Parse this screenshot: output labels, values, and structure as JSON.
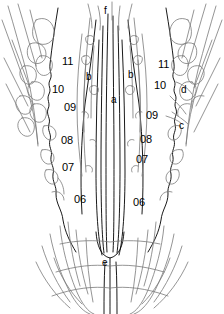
{
  "figure": {
    "type": "line-drawing-anatomical-diagram",
    "background_color": "#ffffff",
    "ink_color": "#000000",
    "light_ink_color": "#808080",
    "width": 224,
    "height": 314
  },
  "labels": [
    {
      "id": "f",
      "text": "f",
      "kind": "letter",
      "x": 106,
      "y": 12
    },
    {
      "id": "b-left",
      "text": "b",
      "kind": "letter",
      "x": 88,
      "y": 78
    },
    {
      "id": "b-right",
      "text": "b",
      "kind": "letter",
      "x": 130,
      "y": 76
    },
    {
      "id": "a",
      "text": "a",
      "kind": "letter",
      "x": 113,
      "y": 101
    },
    {
      "id": "d",
      "text": "d",
      "kind": "letter",
      "x": 183,
      "y": 91
    },
    {
      "id": "c",
      "text": "c",
      "kind": "letter",
      "x": 181,
      "y": 127
    },
    {
      "id": "e",
      "text": "e",
      "kind": "letter",
      "x": 104,
      "y": 264
    },
    {
      "id": "left-11",
      "text": "11",
      "kind": "number",
      "x": 62,
      "y": 62
    },
    {
      "id": "left-10",
      "text": "10",
      "kind": "number",
      "x": 52,
      "y": 90
    },
    {
      "id": "left-09",
      "text": "09",
      "kind": "number",
      "x": 64,
      "y": 108
    },
    {
      "id": "left-08",
      "text": "08",
      "kind": "number",
      "x": 61,
      "y": 141
    },
    {
      "id": "left-07",
      "text": "07",
      "kind": "number",
      "x": 62,
      "y": 168
    },
    {
      "id": "left-06",
      "text": "06",
      "kind": "number",
      "x": 74,
      "y": 200
    },
    {
      "id": "right-11",
      "text": "11",
      "kind": "number",
      "x": 160,
      "y": 65
    },
    {
      "id": "right-10",
      "text": "10",
      "kind": "number",
      "x": 156,
      "y": 86
    },
    {
      "id": "right-09",
      "text": "09",
      "kind": "number",
      "x": 148,
      "y": 116
    },
    {
      "id": "right-08",
      "text": "08",
      "kind": "number",
      "x": 142,
      "y": 140
    },
    {
      "id": "right-07",
      "text": "07",
      "kind": "number",
      "x": 138,
      "y": 160
    },
    {
      "id": "right-06",
      "text": "06",
      "kind": "number",
      "x": 135,
      "y": 203
    }
  ]
}
